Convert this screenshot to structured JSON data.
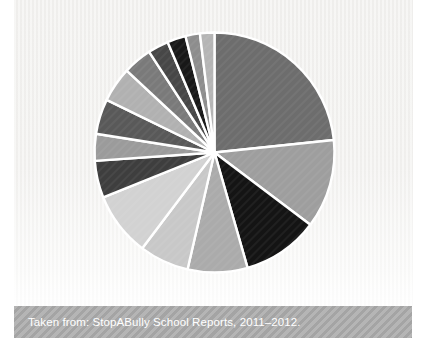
{
  "chart_data": {
    "type": "pie",
    "title": "",
    "legend": "none",
    "data_labels_shown": false,
    "start_angle_deg": 0,
    "direction": "clockwise",
    "slices": [
      {
        "angle_deg": 84,
        "percent": 23.3,
        "color": "#6d6d6d"
      },
      {
        "angle_deg": 43,
        "percent": 11.9,
        "color": "#9e9e9e"
      },
      {
        "angle_deg": 37,
        "percent": 10.3,
        "color": "#141414"
      },
      {
        "angle_deg": 29,
        "percent": 8.1,
        "color": "#abitababab",
        "color_fix": "#ababab"
      },
      {
        "angle_deg": 24,
        "percent": 6.7,
        "color": "#c8c8c8"
      },
      {
        "angle_deg": 31,
        "percent": 8.6,
        "color": "#d2d2d2"
      },
      {
        "angle_deg": 18,
        "percent": 5.0,
        "color": "#3e3e3e"
      },
      {
        "angle_deg": 13,
        "percent": 3.6,
        "color": "#9b9b9b"
      },
      {
        "angle_deg": 17,
        "percent": 4.7,
        "color": "#595959"
      },
      {
        "angle_deg": 17,
        "percent": 4.7,
        "color": "#b1b1b1"
      },
      {
        "angle_deg": 14,
        "percent": 3.9,
        "color": "#7a7a7a"
      },
      {
        "angle_deg": 10,
        "percent": 2.8,
        "color": "#474747"
      },
      {
        "angle_deg": 9,
        "percent": 2.5,
        "color": "#181818"
      },
      {
        "angle_deg": 7,
        "percent": 1.9,
        "color": "#8d8d8d"
      },
      {
        "angle_deg": 7,
        "percent": 1.9,
        "color": "#b5b5b5"
      }
    ],
    "source": "Taken from: StopABully School Reports, 2011–2012."
  },
  "caption": {
    "text": "Taken from: StopABully School Reports, 2011–2012."
  },
  "colors": {
    "chart_background": "#f2f1ef",
    "caption_band_background": "#adadad",
    "caption_text": "#ffffff",
    "slice_separator": "#ffffff"
  },
  "pie_geometry": {
    "center_x": 200.5,
    "center_y": 152.5,
    "radius": 120
  }
}
